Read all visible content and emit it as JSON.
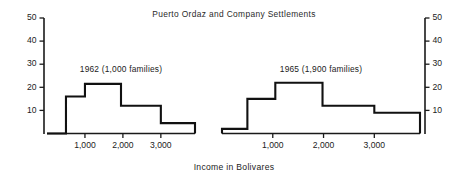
{
  "chart_data": {
    "type": "line",
    "title": "Puerto Ordaz and Company Settlements",
    "xlabel": "Income in Bolivares",
    "ylabel": "",
    "xlim": [
      0,
      3900
    ],
    "ylim": [
      0,
      50
    ],
    "grid": false,
    "legend": "none",
    "x_ticks": [
      1000,
      2000,
      3000
    ],
    "x_tick_labels": [
      "1,000",
      "2,000",
      "3,000"
    ],
    "y_ticks": [
      10,
      20,
      30,
      40,
      50
    ],
    "y_tick_labels": [
      "10",
      "20",
      "30",
      "40",
      "50"
    ],
    "y_axis_right_labels": [
      "10",
      "20",
      "30",
      "40",
      "50"
    ],
    "panels": [
      {
        "name": "1962",
        "label": "1962 (1,000 families)",
        "bin_edges": [
          0,
          500,
          1000,
          1950,
          3000,
          3900
        ],
        "values": [
          0,
          16,
          21.5,
          12,
          4.5
        ]
      },
      {
        "name": "1965",
        "label": "1965 (1,900 families)",
        "bin_edges": [
          0,
          500,
          1050,
          1980,
          3000,
          3900
        ],
        "values": [
          2,
          15,
          22,
          12,
          9
        ]
      }
    ]
  },
  "style": {
    "line_color": "#111111",
    "axis_color": "#1a1a1a",
    "text_color": "#222222",
    "background": "#ffffff"
  }
}
